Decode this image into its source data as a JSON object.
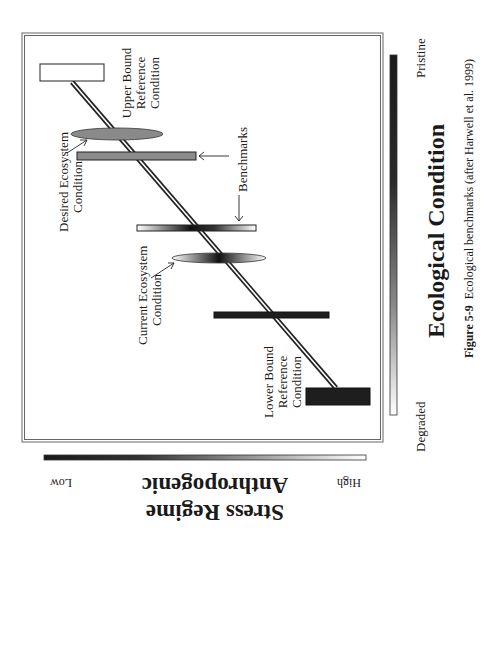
{
  "figure": {
    "caption_label": "Figure 5-9",
    "caption_text": "Ecological benchmarks (after Harwell et al. 1999)"
  },
  "axes": {
    "x_axis": {
      "title": "Ecological Condition",
      "low_label": "Degraded",
      "high_label": "Pristine"
    },
    "y_axis": {
      "title_line1": "Anthropogenic",
      "title_line2": "Stress Regime",
      "low_label": "Low",
      "high_label": "High"
    }
  },
  "labels": {
    "upper_bound": [
      "Upper Bound",
      "Reference",
      "Condition"
    ],
    "lower_bound": [
      "Lower Bound",
      "Reference",
      "Condition"
    ],
    "desired": [
      "Desired Ecosystem",
      "Condition"
    ],
    "current": [
      "Current Ecosystem",
      "Condition"
    ],
    "benchmarks_1": "Benchmarks",
    "benchmarks_2": "Benchmarks"
  },
  "colors": {
    "dark": "#1e1e1e",
    "gray": "#8a8a8a",
    "frame": "#555555"
  }
}
